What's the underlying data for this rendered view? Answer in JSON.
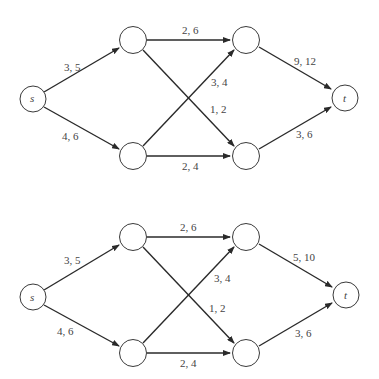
{
  "figure": {
    "graphs": [
      {
        "id": "top",
        "source_label": "s",
        "sink_label": "t",
        "edges": [
          {
            "from": "s",
            "to": "a",
            "label": "3, 5"
          },
          {
            "from": "s",
            "to": "b",
            "label": "4, 6"
          },
          {
            "from": "a",
            "to": "c",
            "label": "2, 6"
          },
          {
            "from": "a",
            "to": "d",
            "label": "1, 2"
          },
          {
            "from": "b",
            "to": "c",
            "label": "3, 4"
          },
          {
            "from": "b",
            "to": "d",
            "label": "2, 4"
          },
          {
            "from": "c",
            "to": "t",
            "label": "9, 12"
          },
          {
            "from": "d",
            "to": "t",
            "label": "3, 6"
          }
        ]
      },
      {
        "id": "bottom",
        "source_label": "s",
        "sink_label": "t",
        "edges": [
          {
            "from": "s",
            "to": "a",
            "label": "3, 5"
          },
          {
            "from": "s",
            "to": "b",
            "label": "4, 6"
          },
          {
            "from": "a",
            "to": "c",
            "label": "2, 6"
          },
          {
            "from": "a",
            "to": "d",
            "label": "1, 2"
          },
          {
            "from": "b",
            "to": "c",
            "label": "3, 4"
          },
          {
            "from": "b",
            "to": "d",
            "label": "2, 4"
          },
          {
            "from": "c",
            "to": "t",
            "label": "5, 10"
          },
          {
            "from": "d",
            "to": "t",
            "label": "3, 6"
          }
        ]
      }
    ]
  }
}
